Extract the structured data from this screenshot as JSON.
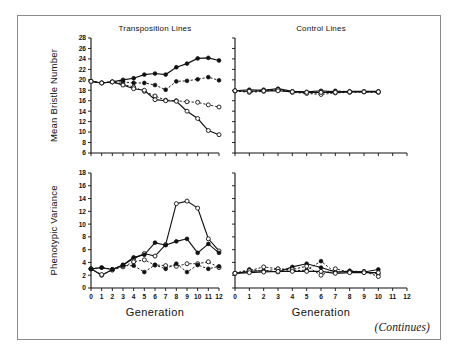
{
  "figure": {
    "caption_note": "(Continues)",
    "panels": [
      {
        "id": "top-left",
        "title": "Transposition Lines"
      },
      {
        "id": "top-right",
        "title": "Control Lines"
      },
      {
        "id": "bottom-left",
        "title": ""
      },
      {
        "id": "bottom-right",
        "title": ""
      }
    ],
    "axis_labels": {
      "y_top": "Mean Bristle Number",
      "y_bottom": "Phenotypic Variance",
      "x_left": "Generation",
      "x_right": "Generation"
    }
  },
  "chart_data": [
    {
      "id": "top-left",
      "type": "line",
      "title": "Transposition Lines",
      "xlabel": "Generation",
      "ylabel": "Mean Bristle Number",
      "xlim": [
        0,
        12
      ],
      "ylim": [
        6,
        28
      ],
      "xticks": [
        0,
        1,
        2,
        3,
        4,
        5,
        6,
        7,
        8,
        9,
        10,
        11,
        12
      ],
      "yticks": [
        6,
        8,
        10,
        12,
        14,
        16,
        18,
        20,
        22,
        24,
        26,
        28
      ],
      "xticklabels": [
        "0",
        "1",
        "2",
        "3",
        "4",
        "5",
        "6",
        "7",
        "8",
        "9",
        "10",
        "11",
        "12"
      ],
      "yticklabels": [
        "6",
        "8",
        "10",
        "12",
        "14",
        "16",
        "18",
        "20",
        "22",
        "24",
        "26",
        "28"
      ],
      "grid": false,
      "legend": "none",
      "series": [
        {
          "name": "Transposition high line A",
          "marker": "filled-circle",
          "linestyle": "solid",
          "x": [
            0,
            1,
            2,
            3,
            4,
            5,
            6,
            7,
            8,
            9,
            10,
            11,
            12
          ],
          "values": [
            19.7,
            19.4,
            19.6,
            20.0,
            20.3,
            21.0,
            21.2,
            21.0,
            22.4,
            23.1,
            24.1,
            24.2,
            23.7
          ]
        },
        {
          "name": "Transposition high line B",
          "marker": "filled-circle",
          "linestyle": "dotted",
          "x": [
            0,
            1,
            2,
            3,
            4,
            5,
            6,
            7,
            8,
            9,
            10,
            11,
            12
          ],
          "values": [
            19.7,
            19.4,
            19.6,
            19.6,
            19.4,
            19.4,
            19.0,
            18.1,
            19.7,
            19.8,
            20.1,
            20.5,
            19.9
          ]
        },
        {
          "name": "Transposition low line A",
          "marker": "open-circle",
          "linestyle": "dotted",
          "x": [
            0,
            1,
            2,
            3,
            4,
            5,
            6,
            7,
            8,
            9,
            10,
            11,
            12
          ],
          "values": [
            19.7,
            19.4,
            19.6,
            19.1,
            18.6,
            17.8,
            16.9,
            16.1,
            16.0,
            15.8,
            15.7,
            15.2,
            14.8
          ]
        },
        {
          "name": "Transposition low line B",
          "marker": "open-circle",
          "linestyle": "solid",
          "x": [
            0,
            1,
            2,
            3,
            4,
            5,
            6,
            7,
            8,
            9,
            10,
            11,
            12
          ],
          "values": [
            19.7,
            19.4,
            19.6,
            19.0,
            18.3,
            18.0,
            16.2,
            16.0,
            15.9,
            14.0,
            12.6,
            10.3,
            9.5
          ]
        }
      ]
    },
    {
      "id": "top-right",
      "type": "line",
      "title": "Control Lines",
      "xlabel": "Generation",
      "ylabel": "Mean Bristle Number",
      "xlim": [
        0,
        12
      ],
      "ylim": [
        6,
        28
      ],
      "xticks": [
        0,
        1,
        2,
        3,
        4,
        5,
        6,
        7,
        8,
        9,
        10,
        11,
        12
      ],
      "yticks": [
        6,
        8,
        10,
        12,
        14,
        16,
        18,
        20,
        22,
        24,
        26,
        28
      ],
      "xticklabels": [
        "0",
        "1",
        "2",
        "3",
        "4",
        "5",
        "6",
        "7",
        "8",
        "9",
        "10",
        "11",
        "12"
      ],
      "yticklabels": [
        "6",
        "8",
        "10",
        "12",
        "14",
        "16",
        "18",
        "20",
        "22",
        "24",
        "26",
        "28"
      ],
      "grid": false,
      "legend": "none",
      "series": [
        {
          "name": "Control line 1",
          "marker": "filled-circle",
          "linestyle": "solid",
          "x": [
            0,
            1,
            2,
            3,
            4,
            5,
            6,
            7,
            8,
            9,
            10
          ],
          "values": [
            17.9,
            18.1,
            18.0,
            18.3,
            17.8,
            17.7,
            17.9,
            17.7,
            17.8,
            17.8,
            17.8
          ]
        },
        {
          "name": "Control line 2",
          "marker": "filled-circle",
          "linestyle": "dotted",
          "x": [
            0,
            1,
            2,
            3,
            4,
            5,
            6,
            7,
            8,
            9,
            10
          ],
          "values": [
            17.9,
            17.7,
            18.1,
            18.0,
            17.7,
            17.5,
            17.5,
            17.9,
            17.7,
            17.7,
            17.7
          ]
        },
        {
          "name": "Control line 3",
          "marker": "open-circle",
          "linestyle": "dotted",
          "x": [
            0,
            1,
            2,
            3,
            4,
            5,
            6,
            7,
            8,
            9,
            10
          ],
          "values": [
            17.9,
            17.6,
            17.8,
            18.1,
            17.6,
            17.4,
            17.2,
            17.5,
            17.6,
            17.7,
            17.6
          ]
        },
        {
          "name": "Control line 4",
          "marker": "open-circle",
          "linestyle": "solid",
          "x": [
            0,
            1,
            2,
            3,
            4,
            5,
            6,
            7,
            8,
            9,
            10
          ],
          "values": [
            17.9,
            17.8,
            17.9,
            17.9,
            17.7,
            17.6,
            17.6,
            17.6,
            17.7,
            17.7,
            17.7
          ]
        }
      ]
    },
    {
      "id": "bottom-left",
      "type": "line",
      "title": "Transposition Lines",
      "xlabel": "Generation",
      "ylabel": "Phenotypic Variance",
      "xlim": [
        0,
        12
      ],
      "ylim": [
        0,
        18
      ],
      "xticks": [
        0,
        1,
        2,
        3,
        4,
        5,
        6,
        7,
        8,
        9,
        10,
        11,
        12
      ],
      "yticks": [
        0,
        2,
        4,
        6,
        8,
        10,
        12,
        14,
        16,
        18
      ],
      "xticklabels": [
        "0",
        "1",
        "2",
        "3",
        "4",
        "5",
        "6",
        "7",
        "8",
        "9",
        "10",
        "11",
        "12"
      ],
      "yticklabels": [
        "0",
        "2",
        "4",
        "6",
        "8",
        "10",
        "12",
        "14",
        "16",
        "18"
      ],
      "grid": false,
      "legend": "none",
      "series": [
        {
          "name": "Transposition variance line A",
          "marker": "open-circle",
          "linestyle": "solid",
          "x": [
            0,
            1,
            2,
            3,
            4,
            5,
            6,
            7,
            8,
            9,
            10,
            11,
            12
          ],
          "values": [
            3.0,
            2.0,
            2.9,
            3.6,
            4.6,
            5.4,
            5.0,
            6.8,
            13.2,
            13.6,
            12.5,
            7.7,
            5.8
          ]
        },
        {
          "name": "Transposition variance line B",
          "marker": "filled-circle",
          "linestyle": "solid",
          "x": [
            0,
            1,
            2,
            3,
            4,
            5,
            6,
            7,
            8,
            9,
            10,
            11,
            12
          ],
          "values": [
            3.0,
            3.2,
            2.9,
            3.6,
            4.8,
            5.2,
            7.1,
            6.7,
            7.3,
            7.7,
            5.5,
            6.9,
            5.5
          ]
        },
        {
          "name": "Transposition variance line C",
          "marker": "open-circle",
          "linestyle": "dotted",
          "x": [
            0,
            1,
            2,
            3,
            4,
            5,
            6,
            7,
            8,
            9,
            10,
            11,
            12
          ],
          "values": [
            3.0,
            2.1,
            2.8,
            3.3,
            4.1,
            4.4,
            3.6,
            3.5,
            3.4,
            3.8,
            3.8,
            4.1,
            3.2
          ]
        },
        {
          "name": "Transposition variance line D",
          "marker": "filled-circle",
          "linestyle": "dotted",
          "x": [
            0,
            1,
            2,
            3,
            4,
            5,
            6,
            7,
            8,
            9,
            10,
            11,
            12
          ],
          "values": [
            3.0,
            3.2,
            2.9,
            3.5,
            3.5,
            2.5,
            3.6,
            3.0,
            3.8,
            2.5,
            3.6,
            3.0,
            3.4
          ]
        }
      ]
    },
    {
      "id": "bottom-right",
      "type": "line",
      "title": "Control Lines",
      "xlabel": "Generation",
      "ylabel": "Phenotypic Variance",
      "xlim": [
        0,
        12
      ],
      "ylim": [
        0,
        18
      ],
      "xticks": [
        0,
        1,
        2,
        3,
        4,
        5,
        6,
        7,
        8,
        9,
        10,
        11,
        12
      ],
      "yticks": [
        0,
        2,
        4,
        6,
        8,
        10,
        12,
        14,
        16,
        18
      ],
      "xticklabels": [
        "0",
        "1",
        "2",
        "3",
        "4",
        "5",
        "6",
        "7",
        "8",
        "9",
        "10",
        "11",
        "12"
      ],
      "yticklabels": [
        "0",
        "2",
        "4",
        "6",
        "8",
        "10",
        "12",
        "14",
        "16",
        "18"
      ],
      "grid": false,
      "legend": "none",
      "series": [
        {
          "name": "Control variance line 1",
          "marker": "filled-circle",
          "linestyle": "solid",
          "x": [
            0,
            1,
            2,
            3,
            4,
            5,
            6,
            7,
            8,
            9,
            10
          ],
          "values": [
            2.3,
            2.6,
            2.7,
            2.5,
            3.3,
            3.8,
            3.2,
            2.5,
            2.6,
            2.5,
            2.9
          ]
        },
        {
          "name": "Control variance line 2",
          "marker": "filled-circle",
          "linestyle": "dotted",
          "x": [
            0,
            1,
            2,
            3,
            4,
            5,
            6,
            7,
            8,
            9,
            10
          ],
          "values": [
            2.3,
            2.9,
            2.6,
            3.0,
            2.7,
            2.8,
            4.2,
            2.4,
            2.7,
            2.5,
            2.2
          ]
        },
        {
          "name": "Control variance line 3",
          "marker": "open-circle",
          "linestyle": "dotted",
          "x": [
            0,
            1,
            2,
            3,
            4,
            5,
            6,
            7,
            8,
            9,
            10
          ],
          "values": [
            2.3,
            2.7,
            3.3,
            3.0,
            2.9,
            3.4,
            2.0,
            3.0,
            2.5,
            2.6,
            1.8
          ]
        },
        {
          "name": "Control variance line 4",
          "marker": "open-circle",
          "linestyle": "solid",
          "x": [
            0,
            1,
            2,
            3,
            4,
            5,
            6,
            7,
            8,
            9,
            10
          ],
          "values": [
            2.3,
            2.4,
            2.5,
            2.6,
            2.6,
            2.6,
            2.6,
            2.3,
            2.4,
            2.4,
            2.4
          ]
        }
      ]
    }
  ]
}
